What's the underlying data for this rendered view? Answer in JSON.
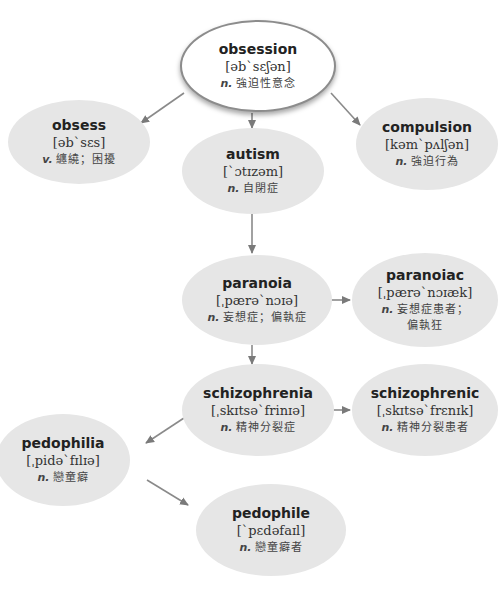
{
  "diagram": {
    "type": "word-relationship-map",
    "colors": {
      "node_fill": "#e6e6e6",
      "root_fill": "#ffffff",
      "root_border": "#8c8c8c",
      "arrow": "#7a7a7a"
    },
    "nodes": {
      "obsession": {
        "word": "obsession",
        "ipa": "[əb`sɛʃən]",
        "pos": "n.",
        "def": "強迫性意念"
      },
      "obsess": {
        "word": "obsess",
        "ipa": "[əb`sɛs]",
        "pos": "v.",
        "def": "纏繞；困擾"
      },
      "compulsion": {
        "word": "compulsion",
        "ipa": "[kəm`pʌlʃən]",
        "pos": "n.",
        "def": "強迫行為"
      },
      "autism": {
        "word": "autism",
        "ipa": "[`ɔtɪzəm]",
        "pos": "n.",
        "def": "自閉症"
      },
      "paranoia": {
        "word": "paranoia",
        "ipa": "[ˌpærə`nɔɪə]",
        "pos": "n.",
        "def": "妄想症；偏執症"
      },
      "paranoiac": {
        "word": "paranoiac",
        "ipa": "[ˌpærə`nɔɪæk]",
        "pos": "n.",
        "def": "妄想症患者；",
        "def2": "偏執狂"
      },
      "schizophrenia": {
        "word": "schizophrenia",
        "ipa": "[ˌskɪtsə`frinɪə]",
        "pos": "n.",
        "def": "精神分裂症"
      },
      "schizophrenic": {
        "word": "schizophrenic",
        "ipa": "[ˌskɪtsə`frɛnɪk]",
        "pos": "n.",
        "def": "精神分裂患者"
      },
      "pedophilia": {
        "word": "pedophilia",
        "ipa": "[ˌpidə`fɪlɪə]",
        "pos": "n.",
        "def": "戀童癖"
      },
      "pedophile": {
        "word": "pedophile",
        "ipa": "[`pɛdəfaɪl]",
        "pos": "n.",
        "def": "戀童癖者"
      }
    },
    "edges": [
      {
        "from": "obsession",
        "to": "obsess"
      },
      {
        "from": "obsession",
        "to": "compulsion"
      },
      {
        "from": "obsession",
        "to": "autism"
      },
      {
        "from": "autism",
        "to": "paranoia"
      },
      {
        "from": "paranoia",
        "to": "paranoiac"
      },
      {
        "from": "paranoia",
        "to": "schizophrenia"
      },
      {
        "from": "schizophrenia",
        "to": "schizophrenic"
      },
      {
        "from": "schizophrenia",
        "to": "pedophilia"
      },
      {
        "from": "pedophilia",
        "to": "pedophile"
      }
    ]
  }
}
